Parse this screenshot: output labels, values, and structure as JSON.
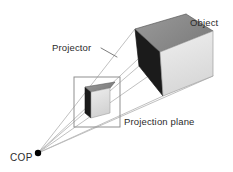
{
  "figure": {
    "type": "perspective-projection-diagram",
    "background_color": "#ffffff",
    "width": 233,
    "height": 172
  },
  "labels": {
    "object": "Object",
    "projector": "Projector",
    "projection_plane": "Projection plane",
    "cop": "COP"
  },
  "colors": {
    "cube_top_face": "#8c8c8c",
    "cube_left_face": "#1c1c1c",
    "cube_front_face": "#e2e2e2",
    "cube_outline": "#4a4a4a",
    "ray": "#b9b9b9",
    "plane_frame": "#8f8f8f",
    "cop_dot": "#000000",
    "label_text": "#2b2b2b",
    "leader_line": "#6e6e6e"
  },
  "geometry": {
    "cop_point": {
      "x": 38,
      "y": 153,
      "radius": 3.2
    },
    "projection_plane_rect": {
      "x": 74,
      "y": 77,
      "width": 46,
      "height": 50
    },
    "small_cube": {
      "name": "projected-image-cube",
      "front_face": [
        [
          91,
          92
        ],
        [
          110,
          88
        ],
        [
          110,
          113
        ],
        [
          91,
          118
        ]
      ],
      "top_face": [
        [
          91,
          92
        ],
        [
          97,
          85
        ],
        [
          115,
          82
        ],
        [
          110,
          88
        ]
      ],
      "left_face": [
        [
          91,
          92
        ],
        [
          91,
          118
        ],
        [
          85,
          113
        ],
        [
          85,
          87
        ]
      ],
      "left_top": [
        [
          85,
          87
        ],
        [
          91,
          92
        ],
        [
          97,
          85
        ]
      ]
    },
    "large_cube": {
      "name": "object-cube",
      "front_face": [
        [
          160,
          52
        ],
        [
          213,
          31
        ],
        [
          213,
          76
        ],
        [
          163,
          96
        ]
      ],
      "top_face": [
        [
          160,
          52
        ],
        [
          186,
          14
        ],
        [
          213,
          31
        ],
        [
          160,
          52
        ]
      ],
      "left_face": [
        [
          160,
          52
        ],
        [
          163,
          96
        ],
        [
          139,
          66
        ],
        [
          135,
          29
        ]
      ],
      "top_back": [
        [
          135,
          29
        ],
        [
          160,
          52
        ],
        [
          186,
          14
        ]
      ]
    },
    "projector_rays": [
      {
        "from": [
          38,
          153
        ],
        "to": [
          186,
          14
        ]
      },
      {
        "from": [
          38,
          153
        ],
        "to": [
          135,
          29
        ]
      },
      {
        "from": [
          38,
          153
        ],
        "to": [
          213,
          31
        ]
      },
      {
        "from": [
          38,
          153
        ],
        "to": [
          213,
          76
        ]
      },
      {
        "from": [
          38,
          153
        ],
        "to": [
          163,
          96
        ]
      },
      {
        "from": [
          38,
          153
        ],
        "to": [
          139,
          66
        ]
      }
    ],
    "leader_line": {
      "from": [
        101,
        48
      ],
      "to": [
        117,
        57
      ]
    },
    "label_positions": {
      "object": {
        "x": 190,
        "y": 26
      },
      "projector": {
        "x": 52,
        "y": 51
      },
      "projection_plane": {
        "x": 124,
        "y": 125
      },
      "cop": {
        "x": 10,
        "y": 161
      }
    }
  }
}
